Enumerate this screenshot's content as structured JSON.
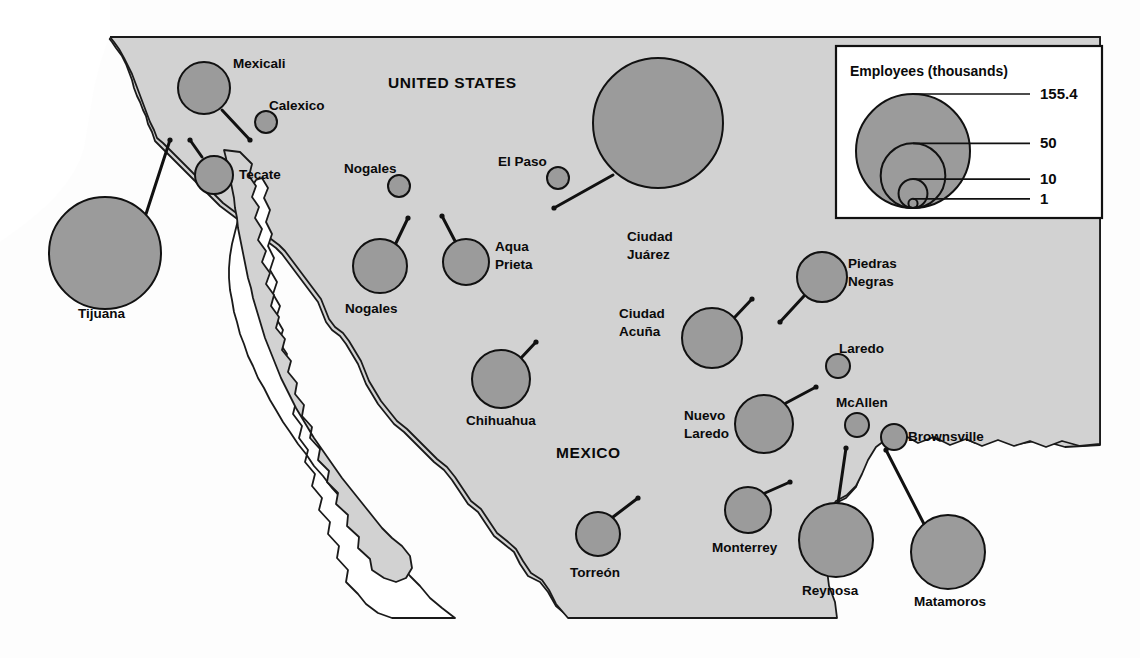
{
  "figure": {
    "colors": {
      "land": "#d2d2d2",
      "water": "#ffffff",
      "circle_fill": "#9b9b9b",
      "outline": "#111111",
      "text": "#0a0a0a"
    }
  },
  "map_labels": {
    "united_states": "UNITED STATES",
    "mexico": "MEXICO"
  },
  "legend": {
    "title": "Employees (thousands)",
    "entries": [
      {
        "value": "155.4",
        "size": 155.4
      },
      {
        "value": "50",
        "size": 50
      },
      {
        "value": "10",
        "size": 10
      },
      {
        "value": "1",
        "size": 1
      }
    ]
  },
  "chart_data": {
    "type": "scatter",
    "title": "Employees (thousands)",
    "xlabel": "",
    "ylabel": "",
    "units": "thousands of employees",
    "encoding": "circle area proportional to employee count",
    "legend_breaks": [
      155.4,
      50,
      10,
      1
    ],
    "points": [
      {
        "name": "Mexicali",
        "country": "Mexico",
        "value": 46,
        "cx": 204,
        "cy": 88,
        "r": 26,
        "label_x": 233,
        "label_y": 68,
        "label_anchor": "start",
        "lines": [
          "Mexicali"
        ],
        "leader": [
          [
            222,
            110
          ],
          [
            250,
            140
          ]
        ]
      },
      {
        "name": "Calexico",
        "country": "United States",
        "value": 2,
        "cx": 266,
        "cy": 122,
        "r": 11,
        "label_x": 269,
        "label_y": 110,
        "label_anchor": "start",
        "lines": [
          "Calexico"
        ],
        "leader": null
      },
      {
        "name": "Tecate",
        "country": "Mexico",
        "value": 14,
        "cx": 214,
        "cy": 175,
        "r": 19,
        "label_x": 239,
        "label_y": 179,
        "label_anchor": "start",
        "lines": [
          "Tecate"
        ],
        "leader": [
          [
            202,
            157
          ],
          [
            190,
            140
          ]
        ]
      },
      {
        "name": "Tijuana",
        "country": "Mexico",
        "value": 95,
        "cx": 105,
        "cy": 253,
        "r": 56,
        "label_x": 78,
        "label_y": 318,
        "label_anchor": "start",
        "lines": [
          "Tijuana"
        ],
        "leader": [
          [
            146,
            214
          ],
          [
            170,
            140
          ]
        ]
      },
      {
        "name": "Nogales (US)",
        "country": "United States",
        "value": 2,
        "cx": 399,
        "cy": 186,
        "r": 11,
        "label_x": 344,
        "label_y": 173,
        "label_anchor": "start",
        "lines": [
          "Nogales"
        ],
        "leader": null
      },
      {
        "name": "Nogales (MX)",
        "country": "Mexico",
        "value": 22,
        "cx": 380,
        "cy": 266,
        "r": 27,
        "label_x": 345,
        "label_y": 313,
        "label_anchor": "start",
        "lines": [
          "Nogales"
        ],
        "leader": [
          [
            396,
            243
          ],
          [
            408,
            218
          ]
        ]
      },
      {
        "name": "Agua Prieta",
        "country": "Mexico",
        "value": 16,
        "cx": 466,
        "cy": 262,
        "r": 23,
        "label_x": 495,
        "label_y": 251,
        "label_anchor": "start",
        "lines": [
          "Aqua",
          "Prieta"
        ],
        "leader": [
          [
            455,
            241
          ],
          [
            442,
            216
          ]
        ]
      },
      {
        "name": "El Paso",
        "country": "United States",
        "value": 2,
        "cx": 558,
        "cy": 178,
        "r": 11,
        "label_x": 498,
        "label_y": 166,
        "label_anchor": "start",
        "lines": [
          "El Paso"
        ],
        "leader": null
      },
      {
        "name": "Ciudad Juárez",
        "country": "Mexico",
        "value": 155.4,
        "cx": 658,
        "cy": 123,
        "r": 65,
        "label_x": 627,
        "label_y": 241,
        "label_anchor": "start",
        "lines": [
          "Ciudad",
          "Juárez"
        ],
        "leader": [
          [
            613,
            175
          ],
          [
            554,
            208
          ]
        ]
      },
      {
        "name": "Chihuahua",
        "country": "Mexico",
        "value": 24,
        "cx": 501,
        "cy": 379,
        "r": 29,
        "label_x": 466,
        "label_y": 425,
        "label_anchor": "start",
        "lines": [
          "Chihuahua"
        ],
        "leader": [
          [
            521,
            358
          ],
          [
            536,
            342
          ]
        ]
      },
      {
        "name": "Ciudad Acuña",
        "country": "Mexico",
        "value": 26,
        "cx": 712,
        "cy": 338,
        "r": 30,
        "label_x": 619,
        "label_y": 318,
        "label_anchor": "start",
        "lines": [
          "Ciudad",
          "Acuña"
        ],
        "leader": [
          [
            734,
            318
          ],
          [
            752,
            299
          ]
        ]
      },
      {
        "name": "Piedras Negras",
        "country": "Mexico",
        "value": 21,
        "cx": 822,
        "cy": 277,
        "r": 25,
        "label_x": 848,
        "label_y": 268,
        "label_anchor": "start",
        "lines": [
          "Piedras",
          "Negras"
        ],
        "leader": [
          [
            804,
            296
          ],
          [
            780,
            322
          ]
        ]
      },
      {
        "name": "Laredo",
        "country": "United States",
        "value": 2,
        "cx": 838,
        "cy": 366,
        "r": 12,
        "label_x": 839,
        "label_y": 353,
        "label_anchor": "start",
        "lines": [
          "Laredo"
        ],
        "leader": null
      },
      {
        "name": "Nuevo Laredo",
        "country": "Mexico",
        "value": 25,
        "cx": 764,
        "cy": 424,
        "r": 29,
        "label_x": 684,
        "label_y": 420,
        "label_anchor": "start",
        "lines": [
          "Nuevo",
          "Laredo"
        ],
        "leader": [
          [
            786,
            403
          ],
          [
            816,
            387
          ]
        ]
      },
      {
        "name": "McAllen",
        "country": "United States",
        "value": 2,
        "cx": 857,
        "cy": 425,
        "r": 12,
        "label_x": 836,
        "label_y": 407,
        "label_anchor": "start",
        "lines": [
          "McAllen"
        ],
        "leader": null
      },
      {
        "name": "Brownsville",
        "country": "United States",
        "value": 3,
        "cx": 894,
        "cy": 437,
        "r": 13,
        "label_x": 908,
        "label_y": 441,
        "label_anchor": "start",
        "lines": [
          "Brownsville"
        ],
        "leader": null
      },
      {
        "name": "Monterrey",
        "country": "Mexico",
        "value": 17,
        "cx": 748,
        "cy": 510,
        "r": 23,
        "label_x": 712,
        "label_y": 552,
        "label_anchor": "start",
        "lines": [
          "Monterrey"
        ],
        "leader": [
          [
            765,
            493
          ],
          [
            790,
            482
          ]
        ]
      },
      {
        "name": "Reynosa",
        "country": "Mexico",
        "value": 39,
        "cx": 836,
        "cy": 540,
        "r": 37,
        "label_x": 802,
        "label_y": 595,
        "label_anchor": "start",
        "lines": [
          "Reynosa"
        ],
        "leader": [
          [
            838,
            503
          ],
          [
            846,
            448
          ]
        ]
      },
      {
        "name": "Matamoros",
        "country": "Mexico",
        "value": 39,
        "cx": 948,
        "cy": 552,
        "r": 37,
        "label_x": 914,
        "label_y": 606,
        "label_anchor": "start",
        "lines": [
          "Matamoros"
        ],
        "leader": [
          [
            924,
            524
          ],
          [
            886,
            450
          ]
        ]
      },
      {
        "name": "Torreón",
        "country": "Mexico",
        "value": 15,
        "cx": 598,
        "cy": 534,
        "r": 22,
        "label_x": 570,
        "label_y": 577,
        "label_anchor": "start",
        "lines": [
          "Torreón"
        ],
        "leader": [
          [
            613,
            517
          ],
          [
            638,
            498
          ]
        ]
      }
    ]
  }
}
